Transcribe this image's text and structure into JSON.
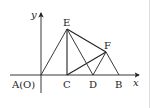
{
  "figure": {
    "type": "geometry-coordinate-diagram",
    "axes": {
      "x_label": "x",
      "y_label": "y",
      "origin_label": "A(O)"
    },
    "points": [
      {
        "name": "A",
        "label": "A(O)",
        "x": 41,
        "y": 75
      },
      {
        "name": "C",
        "label": "C",
        "x": 67,
        "y": 75
      },
      {
        "name": "D",
        "label": "D",
        "x": 93,
        "y": 75
      },
      {
        "name": "B",
        "label": "B",
        "x": 119,
        "y": 75
      },
      {
        "name": "E",
        "label": "E",
        "x": 67,
        "y": 29
      },
      {
        "name": "F",
        "label": "F",
        "x": 106,
        "y": 52
      }
    ],
    "segments": [
      [
        "A",
        "E"
      ],
      [
        "E",
        "C"
      ],
      [
        "E",
        "D"
      ],
      [
        "E",
        "F"
      ],
      [
        "F",
        "B"
      ],
      [
        "C",
        "F"
      ],
      [
        "F",
        "D"
      ]
    ],
    "labels": {
      "E": "E",
      "F": "F",
      "C": "C",
      "D": "D",
      "B": "B",
      "A": "A(O)",
      "x": "x",
      "y": "y"
    },
    "colors": {
      "line": "#222222",
      "background": "#ffffff",
      "border": "#dcdcdc"
    }
  }
}
